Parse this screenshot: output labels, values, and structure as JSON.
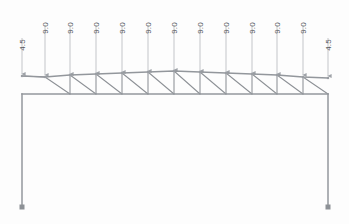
{
  "diagram": {
    "colors": {
      "background": "#fdfdfd",
      "member": "#8d9196",
      "chord": "#9a9ea3",
      "arrow": "#a8acb1",
      "label": "#55585c",
      "support": "#8d9196"
    }
  },
  "chart_data": {
    "type": "diagram",
    "title": "",
    "xlabel": "",
    "ylabel": "",
    "loads": [
      {
        "id": "load-1",
        "value": "4.5",
        "x": 22,
        "tip_y": 74,
        "tail_y": 38,
        "label_y": 45
      },
      {
        "id": "load-2",
        "value": "9.0",
        "x": 45,
        "tip_y": 75,
        "tail_y": 25,
        "label_y": 28
      },
      {
        "id": "load-3",
        "value": "9.0",
        "x": 70,
        "tip_y": 74,
        "tail_y": 25,
        "label_y": 28
      },
      {
        "id": "load-4",
        "value": "9.0",
        "x": 96,
        "tip_y": 73,
        "tail_y": 25,
        "label_y": 28
      },
      {
        "id": "load-5",
        "value": "9.0",
        "x": 122,
        "tip_y": 72,
        "tail_y": 25,
        "label_y": 28
      },
      {
        "id": "load-6",
        "value": "9.0",
        "x": 148,
        "tip_y": 71,
        "tail_y": 25,
        "label_y": 28
      },
      {
        "id": "load-7",
        "value": "9.0",
        "x": 174,
        "tip_y": 70,
        "tail_y": 25,
        "label_y": 28
      },
      {
        "id": "load-8",
        "value": "9.0",
        "x": 200,
        "tip_y": 71,
        "tail_y": 25,
        "label_y": 28
      },
      {
        "id": "load-9",
        "value": "9.0",
        "x": 226,
        "tip_y": 72,
        "tail_y": 25,
        "label_y": 28
      },
      {
        "id": "load-10",
        "value": "9.0",
        "x": 252,
        "tip_y": 73,
        "tail_y": 25,
        "label_y": 28
      },
      {
        "id": "load-11",
        "value": "9.0",
        "x": 277,
        "tip_y": 74,
        "tail_y": 25,
        "label_y": 28
      },
      {
        "id": "load-12",
        "value": "9.0",
        "x": 303,
        "tip_y": 75,
        "tail_y": 25,
        "label_y": 28
      },
      {
        "id": "load-13",
        "value": "4.5",
        "x": 328,
        "tip_y": 76,
        "tail_y": 38,
        "label_y": 45
      }
    ],
    "top_chord": {
      "points": "22,76 45,77 70,75 96,74 122,73 148,72 174,71 200,72 226,73 252,74 277,75 303,77 328,78",
      "apex_x": 174,
      "apex_y": 71
    },
    "bottom_chord": {
      "y": 94,
      "x_start": 22,
      "x_end": 328
    },
    "top_nodes_x": [
      22,
      45,
      70,
      96,
      122,
      148,
      174,
      200,
      226,
      252,
      277,
      303,
      328
    ],
    "bottom_nodes_x": [
      22,
      70,
      122,
      174,
      226,
      277,
      328
    ],
    "columns": [
      {
        "id": "left-column",
        "x": 22,
        "y_top": 94,
        "y_bottom": 207
      },
      {
        "id": "right-column",
        "x": 328,
        "y_top": 94,
        "y_bottom": 207
      }
    ],
    "supports": [
      {
        "id": "left-support",
        "x": 22,
        "y": 207
      },
      {
        "id": "right-support",
        "x": 328,
        "y": 207
      }
    ],
    "web_members": [
      "22,76 45,77",
      "45,77 70,94",
      "70,94 70,75",
      "70,75 96,94",
      "96,94 96,74",
      "96,74 122,94",
      "122,94 122,73",
      "122,73 148,94",
      "148,94 148,72",
      "148,72 174,94",
      "174,94 174,71",
      "174,71 200,94",
      "200,94 200,72",
      "200,72 226,94",
      "226,94 226,73",
      "226,73 252,94",
      "252,94 252,74",
      "252,74 277,94",
      "277,94 277,75",
      "277,75 303,94",
      "303,94 303,77",
      "303,77 328,94"
    ]
  }
}
